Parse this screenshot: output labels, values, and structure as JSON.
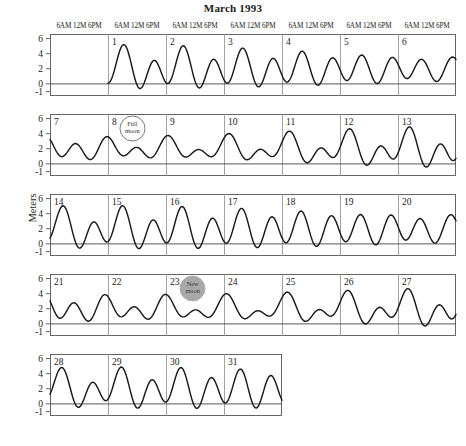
{
  "title": "March 1993",
  "ylabel": "Meters",
  "axis": {
    "y_ticks": [
      "6",
      "4",
      "2",
      "0",
      "-1"
    ],
    "y_tick_values": [
      6,
      4,
      2,
      0,
      -1
    ],
    "ymin": -1.6,
    "ymax": 6.6,
    "zero_line_value": 0,
    "time_ticks": [
      "6AM",
      "12M",
      "6PM"
    ],
    "time_tick_hours": [
      6,
      12,
      18
    ],
    "time_label_text": "6AM 12M 6PM"
  },
  "units": "Meters",
  "rows": [
    {
      "row_index": 0,
      "days": [
        "",
        "1",
        "2",
        "3",
        "4",
        "5",
        "6"
      ],
      "start_day": 0,
      "num_cols": 7,
      "has_leading_blank": true
    },
    {
      "row_index": 1,
      "days": [
        "7",
        "8",
        "9",
        "10",
        "11",
        "12",
        "13"
      ],
      "start_day": 7,
      "num_cols": 7,
      "has_leading_blank": false
    },
    {
      "row_index": 2,
      "days": [
        "14",
        "15",
        "16",
        "17",
        "18",
        "19",
        "20"
      ],
      "start_day": 14,
      "num_cols": 7,
      "has_leading_blank": false
    },
    {
      "row_index": 3,
      "days": [
        "21",
        "22",
        "23",
        "24",
        "25",
        "26",
        "27"
      ],
      "start_day": 21,
      "num_cols": 7,
      "has_leading_blank": false
    },
    {
      "row_index": 4,
      "days": [
        "28",
        "29",
        "30",
        "31"
      ],
      "start_day": 28,
      "num_cols": 4,
      "has_leading_blank": false
    }
  ],
  "annotations": [
    {
      "name": "full-moon",
      "label_line1": "Full",
      "label_line2": "moon",
      "row_index": 1,
      "day": 8,
      "day_fraction": 0.42,
      "fill": "#ffffff",
      "stroke": "#555555",
      "text_color": "#333333",
      "radius": 12.5
    },
    {
      "name": "new-moon",
      "label_line1": "New",
      "label_line2": "moon",
      "row_index": 3,
      "day": 23,
      "day_fraction": 0.46,
      "fill": "#a8a8a8",
      "stroke": "#a8a8a8",
      "text_color": "#3a3a3a",
      "radius": 12.5
    }
  ],
  "colors": {
    "curve": "#1a1a1a",
    "frame": "#555555",
    "gridline": "#8a8a8a",
    "zero_line": "#444444",
    "text": "#1a1a1a",
    "background": "#ffffff"
  },
  "chart_data": {
    "type": "line",
    "title": "March 1993",
    "xlabel": "",
    "ylabel": "Meters",
    "ylim": [
      -1.6,
      6.6
    ],
    "yticks": [
      6,
      4,
      2,
      0,
      -1
    ],
    "grid": true,
    "legend": false,
    "x_unit": "day of month (March 1993), hourly samples",
    "harmonics": [
      {
        "name": "M2",
        "period_hours": 12.42,
        "amplitude": 1.55,
        "phase_deg": 170
      },
      {
        "name": "S2",
        "period_hours": 12.0,
        "amplitude": 0.62,
        "phase_deg": 150
      },
      {
        "name": "K1",
        "period_hours": 23.93,
        "amplitude": 0.78,
        "phase_deg": 300
      },
      {
        "name": "O1",
        "period_hours": 25.82,
        "amplitude": 0.52,
        "phase_deg": 250
      }
    ],
    "mean_level": 1.95,
    "spring_neap_note": "S2 beats against M2 to give spring/neap cycle of ~14.8 days",
    "series": [
      {
        "name": "Tide height",
        "units": "meters",
        "daily_extremes": [
          {
            "day": 1,
            "high": 2.3,
            "low": 0.8
          },
          {
            "day": 2,
            "high": 2.2,
            "low": 1.2
          },
          {
            "day": 3,
            "high": 3.0,
            "low": 0.4
          },
          {
            "day": 4,
            "high": 3.6,
            "low": 0.0
          },
          {
            "day": 5,
            "high": 4.2,
            "low": -0.6
          },
          {
            "day": 6,
            "high": 4.6,
            "low": -1.1
          },
          {
            "day": 7,
            "high": 5.0,
            "low": -1.3
          },
          {
            "day": 8,
            "high": 5.3,
            "low": -1.4
          },
          {
            "day": 9,
            "high": 5.1,
            "low": -1.3
          },
          {
            "day": 10,
            "high": 4.9,
            "low": -1.1
          },
          {
            "day": 11,
            "high": 4.4,
            "low": -0.8
          },
          {
            "day": 12,
            "high": 3.7,
            "low": -0.2
          },
          {
            "day": 13,
            "high": 3.2,
            "low": 0.5
          },
          {
            "day": 14,
            "high": 2.6,
            "low": 1.0
          },
          {
            "day": 15,
            "high": 2.5,
            "low": 1.4
          },
          {
            "day": 16,
            "high": 3.1,
            "low": 1.0
          },
          {
            "day": 17,
            "high": 3.5,
            "low": 0.6
          },
          {
            "day": 18,
            "high": 3.8,
            "low": 0.1
          },
          {
            "day": 19,
            "high": 4.0,
            "low": 0.0
          },
          {
            "day": 20,
            "high": 4.2,
            "low": -0.1
          },
          {
            "day": 21,
            "high": 4.3,
            "low": -0.4
          },
          {
            "day": 22,
            "high": 4.4,
            "low": -0.5
          },
          {
            "day": 23,
            "high": 4.5,
            "low": -0.6
          },
          {
            "day": 24,
            "high": 4.4,
            "low": -0.6
          },
          {
            "day": 25,
            "high": 4.3,
            "low": -0.5
          },
          {
            "day": 26,
            "high": 4.1,
            "low": -0.3
          },
          {
            "day": 27,
            "high": 3.7,
            "low": 0.1
          },
          {
            "day": 28,
            "high": 3.5,
            "low": 0.2
          },
          {
            "day": 29,
            "high": 3.3,
            "low": 0.5
          },
          {
            "day": 30,
            "high": 2.8,
            "low": 1.0
          },
          {
            "day": 31,
            "high": 3.3,
            "low": 1.1
          }
        ]
      }
    ]
  },
  "geometry": {
    "plot_left": 50,
    "plot_right": 456,
    "col_width": 58,
    "row_tops": [
      34,
      114,
      194,
      274,
      354
    ],
    "row_height": 62,
    "axis_label_row_offset": -12
  }
}
